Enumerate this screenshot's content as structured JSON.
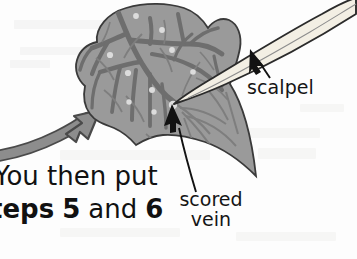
{
  "page": {
    "width": 357,
    "height": 259,
    "background_color": "#fdfdfd",
    "medium": "scanned book illustration"
  },
  "illustration": {
    "name": "leaf-scoring-diagram",
    "description": "A gray leaf with a branching vein network is held while a scalpel blade scores one of the veins; a thick curved arrow enters from the left.",
    "colors": {
      "leaf_fill": "#9a9a9a",
      "leaf_outline": "#3a3a3a",
      "vein": "#6e6e6e",
      "vein_fine": "#7e7e7e",
      "scored_dot": "#d9d9d9",
      "scalpel_fill": "#f3efe4",
      "scalpel_outline": "#2b2b2b",
      "curved_arrow": "#878787",
      "curved_arrow_outline": "#4a4a4a",
      "pointer_arrow": "#121212",
      "text": "#151515"
    },
    "parts": [
      {
        "name": "leaf",
        "label": ""
      },
      {
        "name": "scalpel-blade",
        "label": "scalpel"
      },
      {
        "name": "scored-vein-mark",
        "label": "scored vein"
      },
      {
        "name": "curved-direction-arrow",
        "label": ""
      }
    ]
  },
  "labels": {
    "scalpel": "scalpel",
    "scored_vein_line1": "scored",
    "scored_vein_line2": "vein"
  },
  "body_text": {
    "line1": "You then put",
    "line2_bold_1": "teps",
    "line2_num_1": "5",
    "line2_plain": "and",
    "line2_num_2": "6",
    "note": "left edge of both lines is cropped by the page boundary"
  }
}
